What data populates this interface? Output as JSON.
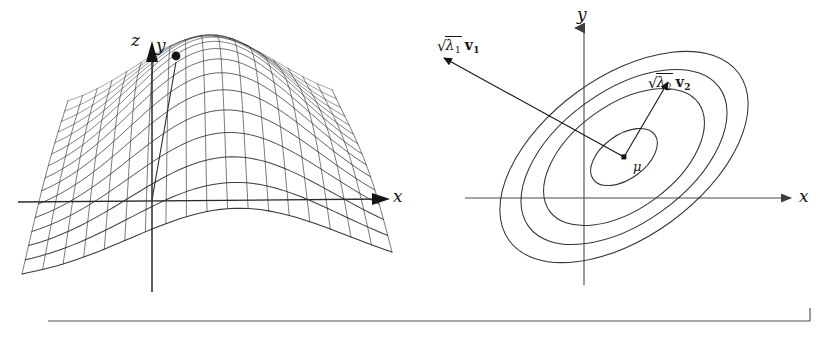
{
  "figure": {
    "width": 826,
    "height": 338,
    "background": "#ffffff",
    "ink_color": "#1a1a1a",
    "mesh_color": "#2b2b2b",
    "axis_color": "#4a4a4a",
    "rule_color": "#555555"
  },
  "left_panel": {
    "name": "gaussian-surface-plot",
    "description": "Three dimensional wireframe mesh of a bivariate normal density over the x-y plane",
    "axes": [
      {
        "id": "z",
        "label": "z",
        "label_x": 131,
        "label_y": 39,
        "direction": "up"
      },
      {
        "id": "y",
        "label": "y",
        "label_x": 158,
        "label_y": 44,
        "direction": "into-page"
      },
      {
        "id": "x",
        "label": "x",
        "label_x": 393,
        "label_y": 196,
        "direction": "right"
      }
    ]
  },
  "right_panel": {
    "name": "gaussian-contour-plot",
    "description": "Concentric ellipse contours of the same bivariate normal, with principal axes annotated",
    "axes": [
      {
        "id": "y",
        "label": "y",
        "label_x": 577,
        "label_y": 14,
        "direction": "up"
      },
      {
        "id": "x",
        "label": "x",
        "label_x": 799,
        "label_y": 189,
        "direction": "right"
      }
    ],
    "center_label": {
      "text": "μ",
      "x": 633,
      "y": 160
    },
    "annotations": [
      {
        "id": "eigen-1",
        "radical_sign": "√",
        "radicand": "λ",
        "radicand_sub": "1",
        "vector": "v",
        "vector_sub": "1",
        "x": 437,
        "y": 36,
        "meaning": "square root of lambda one times eigenvector v one (major semi-axis)"
      },
      {
        "id": "eigen-2",
        "radical_sign": "√",
        "radicand": "λ",
        "radicand_sub": "2",
        "vector": "v",
        "vector_sub": "2",
        "x": 648,
        "y": 73,
        "meaning": "square root of lambda two times eigenvector v two (minor semi-axis)"
      }
    ]
  },
  "chart_data": {
    "type": "contour",
    "xlabel": "x",
    "ylabel": "y",
    "zlabel": "z",
    "distribution": {
      "mean_label": "μ",
      "mean_pixel": [
        624,
        157
      ],
      "eigenvalues": [
        "λ1",
        "λ2"
      ],
      "eigenvectors": [
        "v1",
        "v2"
      ],
      "major_axis_angle_deg": -36,
      "correlation_sign": "positive-in-screen-coords"
    },
    "contours": [
      {
        "level": 1,
        "semi_major": 38,
        "semi_minor": 22
      },
      {
        "level": 2,
        "semi_major": 92,
        "semi_minor": 52
      },
      {
        "level": 3,
        "semi_major": 118,
        "semi_minor": 66
      },
      {
        "level": 4,
        "semi_major": 142,
        "semi_minor": 80
      }
    ],
    "surface": {
      "type": "wireframe",
      "grid_u": 18,
      "grid_v": 14,
      "peak_height_px": 120,
      "peak_center_uv": [
        0.52,
        0.42
      ]
    },
    "legend": "none",
    "grid": false
  },
  "footer_rule": {
    "name": "bottom-rule",
    "x1": 48,
    "x2": 810,
    "y": 321,
    "tick_height": 13,
    "tick_side": "right"
  }
}
